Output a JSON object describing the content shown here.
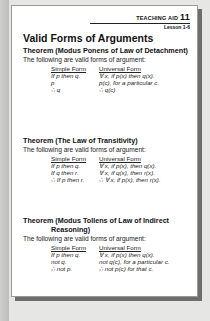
{
  "header": {
    "teaching_aid_label": "TEACHING AID",
    "teaching_aid_number": "11",
    "lesson": "Lesson 1-6"
  },
  "title": "Valid Forms of Arguments",
  "sections": [
    {
      "theorem": "Theorem (Modus Ponens of Law of Detachment)",
      "theorem_cont": "",
      "intro": "The following are valid forms of argument:",
      "simple_header": "Simple Form",
      "universal_header": "Universal Form",
      "simple": [
        "If p then q.",
        "p",
        "∴  q"
      ],
      "universal": [
        "∀ x, if p(x) then q(x).",
        "p(c), for a particular c.",
        "∴  q(c)"
      ]
    },
    {
      "theorem": "Theorem (The Law of Transitivity)",
      "theorem_cont": "",
      "intro": "The following are valid forms of argument:",
      "simple_header": "Simple Form",
      "universal_header": "Universal Form",
      "simple": [
        "If p then q.",
        "If q then r.",
        "∴  If p then r."
      ],
      "universal": [
        "∀ x, if p(x), then q(x).",
        "∀ x, if q(x), then r(x).",
        "∴  ∀ x, if p(x), then r(x)."
      ]
    },
    {
      "theorem": "Theorem (Modus Tollens of Law of Indirect",
      "theorem_cont": "Reasoning)",
      "intro": "The following are valid forms of argument:",
      "simple_header": "Simple Form",
      "universal_header": "Universal Form",
      "simple": [
        "If p then q.",
        "not q.",
        "∴  not p."
      ],
      "universal": [
        "∀ x, if p(x) then q(x).",
        "not q(c), for a particular c.",
        "∴  not p(c) for that c."
      ]
    }
  ]
}
